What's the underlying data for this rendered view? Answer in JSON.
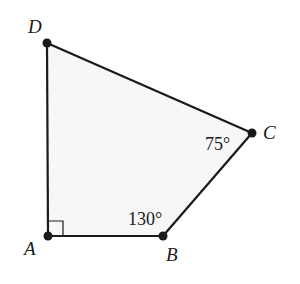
{
  "figure": {
    "type": "quadrilateral",
    "fill_color": "#f7f7f7",
    "stroke_color": "#1a1a1a",
    "vertices": {
      "A": {
        "label": "A",
        "x": 48,
        "y": 236
      },
      "B": {
        "label": "B",
        "x": 163,
        "y": 236
      },
      "C": {
        "label": "C",
        "x": 252,
        "y": 133
      },
      "D": {
        "label": "D",
        "x": 47,
        "y": 43
      }
    },
    "angles": {
      "A": {
        "label": "",
        "marker": "right-angle"
      },
      "B": {
        "label": "130°"
      },
      "C": {
        "label": "75°"
      }
    }
  }
}
